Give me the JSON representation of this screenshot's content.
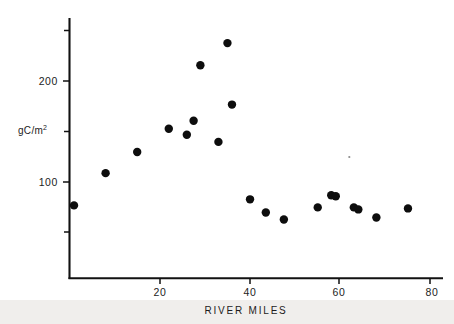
{
  "figure": {
    "name": "river-miles-primary-production-scatter",
    "background_color": "#ffffff",
    "ink_color": "#0d0d0d"
  },
  "axes": {
    "x_title": "RIVER MILES",
    "y_title_main": "gC/m",
    "y_title_sup": "2",
    "x_ticks": [
      "20",
      "40",
      "60",
      "80"
    ],
    "y_ticks": [
      "200",
      "100"
    ]
  },
  "chart_data": {
    "type": "scatter",
    "title": "",
    "xlabel": "RIVER MILES",
    "ylabel": "gC/m2",
    "xlim": [
      0,
      80
    ],
    "ylim": [
      0,
      270
    ],
    "grid": false,
    "legend": null,
    "x_tick_values": [
      20,
      40,
      60,
      80
    ],
    "y_tick_values": [
      100,
      200
    ],
    "y_minor_tick_values": [
      50,
      150,
      250
    ],
    "marker": "filled-circle",
    "marker_color": "#0d0d0d",
    "series": [
      {
        "name": "primary production",
        "points": [
          {
            "x": 1,
            "y": 77
          },
          {
            "x": 8,
            "y": 109
          },
          {
            "x": 15,
            "y": 130
          },
          {
            "x": 22,
            "y": 153
          },
          {
            "x": 26,
            "y": 147
          },
          {
            "x": 27.5,
            "y": 161
          },
          {
            "x": 29,
            "y": 216
          },
          {
            "x": 33,
            "y": 140
          },
          {
            "x": 35,
            "y": 238
          },
          {
            "x": 36,
            "y": 177
          },
          {
            "x": 40,
            "y": 83
          },
          {
            "x": 43.5,
            "y": 70
          },
          {
            "x": 47.5,
            "y": 63
          },
          {
            "x": 55,
            "y": 75
          },
          {
            "x": 58,
            "y": 87
          },
          {
            "x": 59,
            "y": 86
          },
          {
            "x": 63,
            "y": 75
          },
          {
            "x": 64,
            "y": 73
          },
          {
            "x": 68,
            "y": 65
          },
          {
            "x": 75,
            "y": 74
          }
        ]
      }
    ],
    "annotations": [
      {
        "name": "faint-speck",
        "x": 62,
        "y": 125,
        "note": "small faint print speck"
      }
    ]
  }
}
